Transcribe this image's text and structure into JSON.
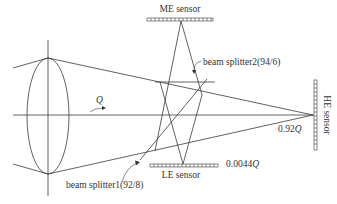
{
  "diagram": {
    "type": "optical beam-splitter sensor layout",
    "labels": {
      "me_sensor": "ME sensor",
      "le_sensor": "LE sensor",
      "he_sensor": "HE sensor",
      "beam_splitter2": "beam splitter2(94/6)",
      "beam_splitter1": "beam splitter1(92/8)",
      "flux_in": "Q",
      "he_fraction_num": "0.92",
      "he_fraction_var": "Q",
      "le_fraction_num": "0.0044",
      "le_fraction_var": "Q"
    },
    "colors": {
      "line": "#3a3a3a",
      "text": "#333333",
      "background": "#ffffff"
    }
  }
}
